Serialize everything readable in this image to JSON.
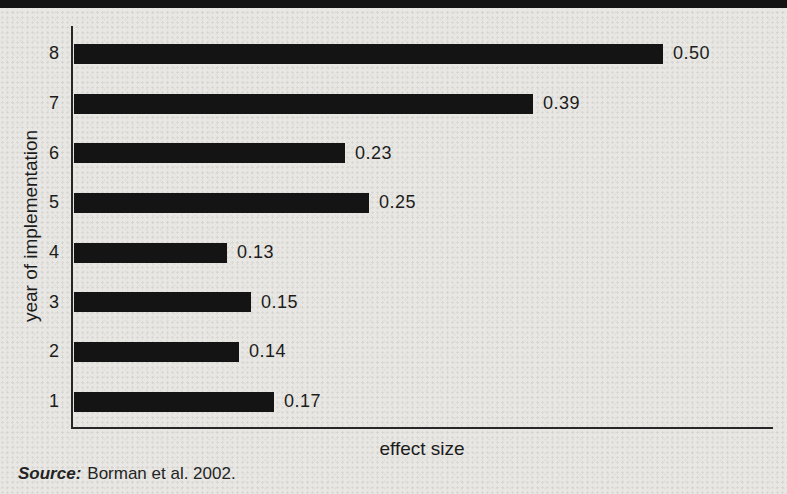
{
  "page": {
    "background_color": "#e8e7e3",
    "top_band_color": "#131313"
  },
  "chart_data": {
    "type": "bar",
    "orientation": "horizontal",
    "title": "",
    "xlabel": "effect size",
    "ylabel": "year of implementation",
    "categories": [
      "8",
      "7",
      "6",
      "5",
      "4",
      "3",
      "2",
      "1"
    ],
    "values": [
      0.5,
      0.39,
      0.23,
      0.25,
      0.13,
      0.15,
      0.14,
      0.17
    ],
    "value_labels": [
      "0.50",
      "0.39",
      "0.23",
      "0.25",
      "0.13",
      "0.15",
      "0.14",
      "0.17"
    ],
    "xlim": [
      0,
      0.59
    ],
    "grid": false,
    "legend": null,
    "bar_color": "#141414",
    "axis_color": "#272727",
    "pixels_per_unit": 1178
  },
  "source_note": {
    "prefix": "Source:",
    "text": "Borman et al. 2002."
  }
}
